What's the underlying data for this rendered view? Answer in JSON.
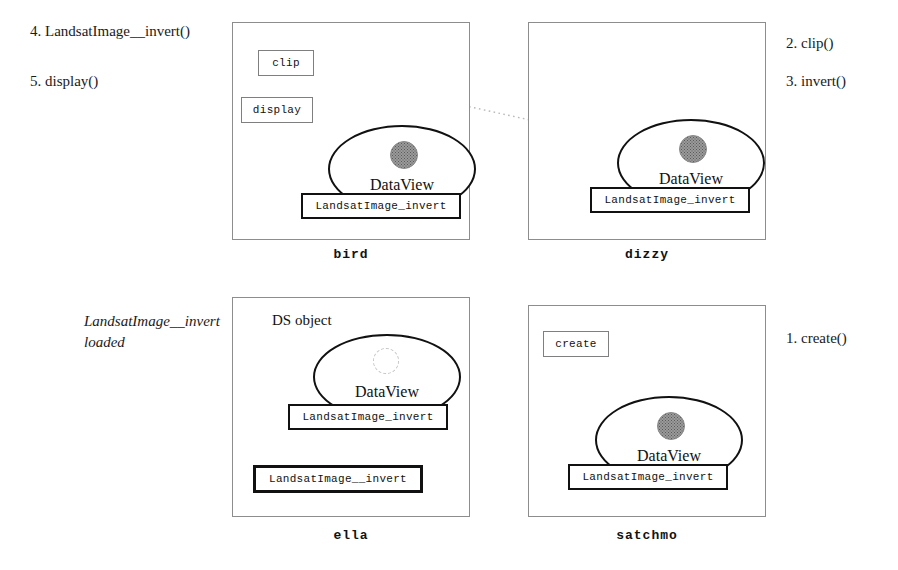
{
  "figure": {
    "type": "distributed-object-migration-diagram"
  },
  "left_annotations": [
    {
      "name": "step-4-label",
      "text": "4. LandsatImage__invert()"
    },
    {
      "name": "step-5-label",
      "text": "5. display()"
    },
    {
      "name": "loaded-note-line1",
      "text": "LandsatImage__invert"
    },
    {
      "name": "loaded-note-line2",
      "text": "loaded"
    }
  ],
  "right_annotations": [
    {
      "name": "step-2-label",
      "text": "2. clip()"
    },
    {
      "name": "step-3-label",
      "text": "3. invert()"
    },
    {
      "name": "step-1-label",
      "text": "1. create()"
    }
  ],
  "hosts": {
    "bird": {
      "name": "bird",
      "dataview_label": "DataView",
      "blob_style": "filled",
      "method_plate": "LandsatImage_invert",
      "messages": [
        {
          "name": "clip-message",
          "text": "clip"
        },
        {
          "name": "display-message",
          "text": "display"
        }
      ]
    },
    "dizzy": {
      "name": "dizzy",
      "dataview_label": "DataView",
      "blob_style": "filled",
      "method_plate": "LandsatImage_invert",
      "messages": []
    },
    "ella": {
      "name": "ella",
      "inner_label": "DS object",
      "dataview_label": "DataView",
      "blob_style": "empty",
      "method_plate": "LandsatImage_invert",
      "loaded_plate": "LandsatImage__invert",
      "messages": []
    },
    "satchmo": {
      "name": "satchmo",
      "dataview_label": "DataView",
      "blob_style": "filled",
      "method_plate": "LandsatImage_invert",
      "messages": [
        {
          "name": "create-message",
          "text": "create"
        }
      ]
    }
  },
  "colors": {
    "ink": "#111111",
    "host_border": "#8d8d8d",
    "dotted_arrow": "#b4b4b4",
    "blob_fill": "#9a9a9a"
  }
}
